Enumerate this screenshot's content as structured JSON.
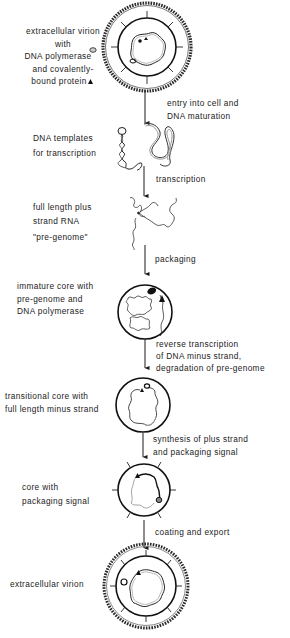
{
  "diagram": {
    "stages": [
      {
        "id": "extracellular-virion-start",
        "label_lines": [
          "extracellular virion",
          "with",
          "DNA polymerase",
          "and covalently-",
          "bound protein"
        ]
      },
      {
        "id": "dna-templates",
        "label_lines": [
          "DNA templates",
          "for transcription"
        ]
      },
      {
        "id": "pregenome",
        "label_lines": [
          "full length plus",
          "strand RNA",
          "\"pre-genome\""
        ]
      },
      {
        "id": "immature-core",
        "label_lines": [
          "immature core with",
          "pre-genome and",
          "DNA polymerase"
        ]
      },
      {
        "id": "transitional-core",
        "label_lines": [
          "transitional core with",
          "full length minus strand"
        ]
      },
      {
        "id": "packaging-core",
        "label_lines": [
          "core with",
          "packaging signal"
        ]
      },
      {
        "id": "extracellular-virion-end",
        "label_lines": [
          "extracellular virion"
        ]
      }
    ],
    "steps": [
      {
        "id": "entry",
        "label_lines": [
          "entry into cell and",
          "DNA maturation"
        ]
      },
      {
        "id": "transcription",
        "label_lines": [
          "transcription"
        ]
      },
      {
        "id": "packaging",
        "label_lines": [
          "packaging"
        ]
      },
      {
        "id": "reverse-transcription",
        "label_lines": [
          "reverse transcription",
          "of DNA minus strand,",
          "degradation of pre-genome"
        ]
      },
      {
        "id": "plus-strand-synthesis",
        "label_lines": [
          "synthesis of plus strand",
          "and packaging signal"
        ]
      },
      {
        "id": "coating-export",
        "label_lines": [
          "coating and export"
        ]
      }
    ],
    "legend_symbols": {
      "polymerase": "polymerase-blob-icon",
      "protein": "triangle-icon"
    },
    "colors": {
      "ink": "#1a1a1a",
      "background": "#ffffff",
      "strand_light": "#9a9a9a"
    }
  }
}
